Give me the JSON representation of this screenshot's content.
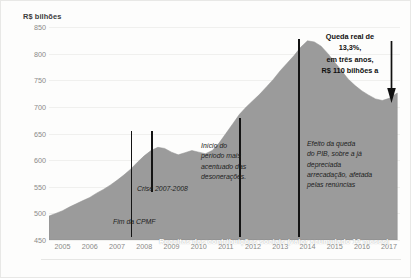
{
  "chart_data": {
    "type": "area",
    "title": "",
    "subtitle": "",
    "xlabel": "",
    "ylabel": "R$ bilhões",
    "ylim": [
      450,
      850
    ],
    "xlim": [
      2005,
      2017.9
    ],
    "grid": true,
    "legend": "none",
    "series_caption": "Receitas das contribuições sociais (valor acumulado 12 meses)",
    "series_color": "#9b9b9b",
    "y_ticks": [
      850,
      800,
      750,
      700,
      650,
      600,
      550,
      500,
      450
    ],
    "x_ticks": [
      2005,
      2006,
      2007,
      2008,
      2009,
      2010,
      2011,
      2012,
      2013,
      2014,
      2015,
      2016,
      2017
    ],
    "series": [
      {
        "name": "Receitas das contribuições sociais (valor acumulado 12 meses)",
        "x": [
          2005.0,
          2005.25,
          2005.5,
          2005.75,
          2006.0,
          2006.25,
          2006.5,
          2006.75,
          2007.0,
          2007.25,
          2007.5,
          2007.75,
          2008.0,
          2008.25,
          2008.5,
          2008.75,
          2009.0,
          2009.25,
          2009.5,
          2009.75,
          2010.0,
          2010.25,
          2010.5,
          2010.75,
          2011.0,
          2011.25,
          2011.5,
          2011.75,
          2012.0,
          2012.25,
          2012.5,
          2012.75,
          2013.0,
          2013.25,
          2013.5,
          2013.75,
          2014.0,
          2014.25,
          2014.5,
          2014.75,
          2015.0,
          2015.25,
          2015.5,
          2015.75,
          2016.0,
          2016.25,
          2016.5,
          2016.75,
          2017.0,
          2017.25,
          2017.5,
          2017.8
        ],
        "values": [
          495,
          500,
          505,
          512,
          518,
          524,
          530,
          538,
          545,
          553,
          562,
          572,
          583,
          596,
          608,
          618,
          624,
          622,
          615,
          610,
          614,
          618,
          615,
          612,
          618,
          632,
          650,
          668,
          686,
          700,
          712,
          724,
          738,
          752,
          768,
          782,
          796,
          812,
          824,
          822,
          814,
          800,
          784,
          768,
          752,
          740,
          730,
          722,
          715,
          712,
          716,
          726
        ]
      }
    ],
    "annotations": [
      {
        "id": "fim-cpmf",
        "label": "Fim da CPMF",
        "x": 2008.0,
        "line_top_value": 655,
        "line_bottom_value": 455
      },
      {
        "id": "crise-2007-2008",
        "label": "Crise 2007-2008",
        "x": 2008.75,
        "line_top_value": 655,
        "line_bottom_value": 540
      },
      {
        "id": "inicio-desoneracoes",
        "label": "Início do\nperíodo mais\nacentuado das\ndesonerações.",
        "x": 2012.0,
        "line_top_value": 680,
        "line_bottom_value": 455
      },
      {
        "id": "efeito-queda-pib",
        "label": "Efeito da queda\ndo PIB, sobre a já\ndepreciada\narrecadação, afetada\npelas renúncias",
        "x": 2014.15,
        "line_top_value": 828,
        "line_bottom_value": 455
      },
      {
        "id": "queda-real",
        "label": "Queda real de\n13,3%,\nem três anos,\nR$ 110 bilhões a",
        "x": 2017.2,
        "arrow": "down-arrow"
      }
    ]
  },
  "axis": {
    "y_title": "R$ bilhões",
    "y_ticks": [
      "850",
      "800",
      "750",
      "700",
      "650",
      "600",
      "550",
      "500",
      "450"
    ],
    "x_ticks": [
      "2005",
      "2006",
      "2007",
      "2008",
      "2009",
      "2010",
      "2011",
      "2012",
      "2013",
      "2014",
      "2015",
      "2016",
      "2017"
    ]
  },
  "caption": {
    "series_caption": "Receitas das contribuições sociais (valor acumulado 12 meses)"
  },
  "annotations": {
    "fim_cpmf": "Fim da CPMF",
    "crise": "Crise 2007-2008",
    "desoneracoes": "Início do\nperíodo mais\nacentuado das\ndesonerações.",
    "efeito_pib": "Efeito da queda\n do PIB, sobre a já\ndepreciada\narrecadação,  afetada\npelas renúncias",
    "queda_real": "Queda real de\n13,3%,\nem três anos,\nR$ 110 bilhões a"
  },
  "icons": {
    "down_arrow": "down-arrow-icon"
  }
}
